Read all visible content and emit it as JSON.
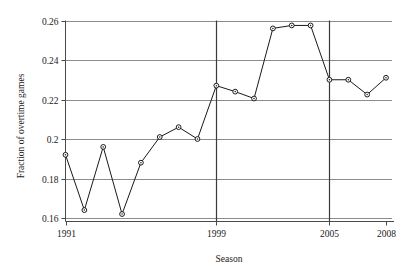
{
  "chart_data": {
    "type": "line",
    "title": "",
    "subtitle": "",
    "xlabel": "Season",
    "ylabel": "Fraction of overtime games",
    "x": [
      1991,
      1992,
      1993,
      1994,
      1995,
      1996,
      1997,
      1998,
      1999,
      2000,
      2001,
      2002,
      2003,
      2004,
      2005,
      2006,
      2007,
      2008
    ],
    "values": [
      0.192,
      0.164,
      0.196,
      0.162,
      0.188,
      0.201,
      0.206,
      0.2,
      0.227,
      0.224,
      0.2205,
      0.256,
      0.2575,
      0.2575,
      0.23,
      0.23,
      0.2225,
      0.231
    ],
    "series": [
      {
        "name": "Fraction of overtime games",
        "values": [
          0.192,
          0.164,
          0.196,
          0.162,
          0.188,
          0.201,
          0.206,
          0.2,
          0.227,
          0.224,
          0.2205,
          0.256,
          0.2575,
          0.2575,
          0.23,
          0.23,
          0.2225,
          0.231
        ]
      }
    ],
    "xlim": [
      1991,
      2008
    ],
    "ylim": [
      0.16,
      0.262
    ],
    "ytick_values": [
      0.16,
      0.18,
      0.2,
      0.22,
      0.24,
      0.26
    ],
    "ytick_labels": [
      "0.16",
      "0.18",
      "0.2",
      "0.22",
      "0.24",
      "0.26"
    ],
    "xtick_values": [
      1991,
      1999,
      2005,
      2008
    ],
    "xtick_labels": [
      "1991",
      "1999",
      "2005",
      "2008"
    ],
    "grid": "horizontal",
    "gridline_color": "#8c8c8c",
    "legend": "none",
    "annotations": [
      {
        "type": "vertical-rule",
        "x": 1999,
        "label": "1999"
      },
      {
        "type": "vertical-rule",
        "x": 2005,
        "label": "2005"
      }
    ],
    "marker": "open-circle",
    "marker_color": "#1a1a1a",
    "line_color": "#1a1a1a",
    "background": "#ffffff"
  }
}
